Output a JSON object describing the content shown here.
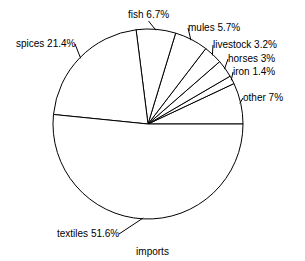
{
  "chart_data": {
    "type": "pie",
    "title": "",
    "caption": "imports",
    "xlabel": "",
    "ylabel": "",
    "legend_position": "none",
    "grid": false,
    "units": "percent",
    "start_angle_deg": 0,
    "direction": "counterclockwise",
    "categories": [
      "other",
      "iron",
      "horses",
      "livestock",
      "mules",
      "fish",
      "spices",
      "textiles"
    ],
    "values": [
      7,
      1.4,
      3,
      3.2,
      5.7,
      6.7,
      21.4,
      51.6
    ],
    "slices": [
      {
        "name": "other",
        "value": 7,
        "label": "other 7%",
        "label_x": 243,
        "label_y": 92,
        "leader": true
      },
      {
        "name": "iron",
        "value": 1.4,
        "label": "iron 1.4%",
        "label_x": 233,
        "label_y": 66,
        "leader": true
      },
      {
        "name": "horses",
        "value": 3,
        "label": "horses 3%",
        "label_x": 228,
        "label_y": 53,
        "leader": true
      },
      {
        "name": "livestock",
        "value": 3.2,
        "label": "livestock 3.2%",
        "label_x": 213,
        "label_y": 39,
        "leader": true
      },
      {
        "name": "mules",
        "value": 5.7,
        "label": "mules 5.7%",
        "label_x": 188,
        "label_y": 22,
        "leader": true
      },
      {
        "name": "fish",
        "value": 6.7,
        "label": "fish 6.7%",
        "label_x": 128,
        "label_y": 9,
        "leader": true
      },
      {
        "name": "spices",
        "value": 21.4,
        "label": "spices 21.4%",
        "label_x": 16,
        "label_y": 38,
        "leader": true
      },
      {
        "name": "textiles",
        "value": 51.6,
        "label": "textiles 51.6%",
        "label_x": 57,
        "label_y": 228,
        "leader": true
      }
    ],
    "geometry": {
      "center_x": 148,
      "center_y": 124,
      "radius": 95
    },
    "colors": {
      "slice_fill": "#ffffff",
      "slice_stroke": "#000000",
      "text": "#000000",
      "background": "#ffffff"
    }
  }
}
